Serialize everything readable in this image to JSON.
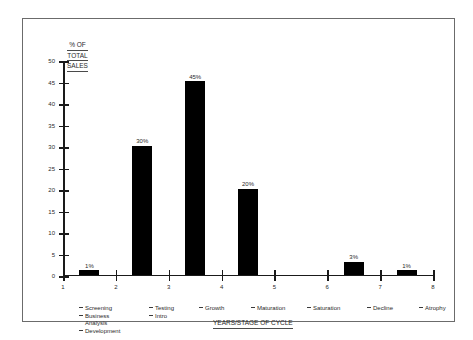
{
  "chart_data": {
    "type": "bar",
    "title": "",
    "ylabel": "% OF TOTAL SALES",
    "xlabel": "YEARS/STAGE OF CYCLE",
    "ylim": [
      0,
      50
    ],
    "xlim": [
      1,
      8
    ],
    "grid": false,
    "legend": "none",
    "y_ticks": [
      0,
      5,
      10,
      15,
      20,
      25,
      30,
      35,
      40,
      45,
      50
    ],
    "x_ticks": [
      1,
      2,
      3,
      4,
      5,
      6,
      7,
      8
    ],
    "categories": [
      "1-2",
      "2-3",
      "3-4",
      "4-5",
      "5-6",
      "6-7",
      "7-8"
    ],
    "values": [
      1,
      30,
      45,
      20,
      0,
      3,
      1
    ],
    "data_labels": [
      "1%",
      "30%",
      "45%",
      "20%",
      "",
      "3%",
      "1%"
    ],
    "bar_color": "#000000",
    "bars": [
      {
        "index": 0,
        "x_start": 1,
        "x_end": 2,
        "value": 1,
        "label": "1%"
      },
      {
        "index": 1,
        "x_start": 2,
        "x_end": 3,
        "value": 30,
        "label": "30%"
      },
      {
        "index": 2,
        "x_start": 3,
        "x_end": 4,
        "value": 45,
        "label": "45%"
      },
      {
        "index": 3,
        "x_start": 4,
        "x_end": 5,
        "value": 20,
        "label": "20%"
      },
      {
        "index": 4,
        "x_start": 5,
        "x_end": 6,
        "value": 0,
        "label": ""
      },
      {
        "index": 5,
        "x_start": 6,
        "x_end": 7,
        "value": 3,
        "label": "3%"
      },
      {
        "index": 6,
        "x_start": 7,
        "x_end": 8,
        "value": 1,
        "label": "1%"
      }
    ]
  },
  "y_axis_title": {
    "line1": "% OF",
    "line2": "TOTAL",
    "line3": "SALES"
  },
  "x_axis_title": "YEARS/STAGE OF CYCLE",
  "stages": [
    {
      "lines": [
        "Screening",
        "Business",
        "Analysis",
        "Development"
      ],
      "indent": [
        false,
        false,
        true,
        false
      ]
    },
    {
      "lines": [
        "Testing",
        "Intro"
      ],
      "indent": [
        false,
        false
      ]
    },
    {
      "lines": [
        "Growth"
      ],
      "indent": [
        false
      ]
    },
    {
      "lines": [
        "Maturation"
      ],
      "indent": [
        false
      ]
    },
    {
      "lines": [
        "Saturation"
      ],
      "indent": [
        false
      ]
    },
    {
      "lines": [
        "Decline"
      ],
      "indent": [
        false
      ]
    },
    {
      "lines": [
        "Atrophy"
      ],
      "indent": [
        false
      ]
    }
  ],
  "colors": {
    "bar": "#000000",
    "axis": "#1a1a1a",
    "frame": "#6b6b6b",
    "text": "#2a2a2a",
    "background": "#ffffff"
  }
}
